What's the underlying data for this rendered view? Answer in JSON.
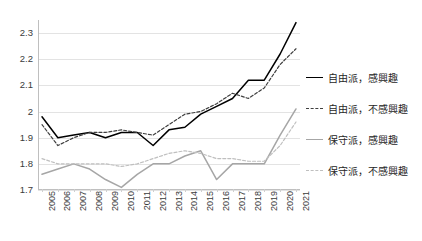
{
  "chart_data": {
    "type": "line",
    "title": "",
    "xlabel": "",
    "ylabel": "",
    "ylim": [
      1.7,
      2.35
    ],
    "yticks": [
      1.7,
      1.8,
      1.9,
      2.0,
      2.1,
      2.2,
      2.3
    ],
    "ytick_labels": [
      "1.7",
      "1.8",
      "1.9",
      "2",
      "2.1",
      "2.2",
      "2.3"
    ],
    "grid": true,
    "legend_position": "right",
    "categories": [
      "2005",
      "2006",
      "2007",
      "2008",
      "2009",
      "2010",
      "2011",
      "2012",
      "2013",
      "2014",
      "2015",
      "2016",
      "2017",
      "2018",
      "2019",
      "2020",
      "2021"
    ],
    "series": [
      {
        "name": "自由派，感興趣",
        "color": "#000000",
        "style": "solid",
        "values": [
          1.98,
          1.9,
          1.91,
          1.92,
          1.9,
          1.92,
          1.92,
          1.87,
          1.93,
          1.94,
          1.99,
          2.02,
          2.05,
          2.12,
          2.12,
          2.22,
          2.34
        ]
      },
      {
        "name": "自由派，不感興趣",
        "color": "#3f3f3f",
        "style": "dashed",
        "values": [
          1.95,
          1.87,
          1.9,
          1.92,
          1.92,
          1.93,
          1.92,
          1.91,
          1.95,
          1.99,
          2.0,
          2.03,
          2.07,
          2.05,
          2.09,
          2.18,
          2.24
        ]
      },
      {
        "name": "保守派，感興趣",
        "color": "#a6a6a6",
        "style": "solid",
        "values": [
          1.76,
          1.78,
          1.8,
          1.78,
          1.74,
          1.71,
          1.76,
          1.8,
          1.8,
          1.83,
          1.85,
          1.74,
          1.8,
          1.8,
          1.8,
          1.91,
          2.01
        ]
      },
      {
        "name": "保守派，不感興趣",
        "color": "#bfbfbf",
        "style": "dashed",
        "values": [
          1.82,
          1.8,
          1.8,
          1.8,
          1.8,
          1.79,
          1.8,
          1.82,
          1.84,
          1.85,
          1.84,
          1.82,
          1.82,
          1.81,
          1.81,
          1.87,
          1.96
        ]
      }
    ]
  },
  "legend": {
    "items": [
      {
        "label": "自由派，感興趣",
        "swatch": "solid-dark"
      },
      {
        "label": "自由派，不感興趣",
        "swatch": "dash-dark"
      },
      {
        "label": "保守派，感興趣",
        "swatch": "solid-gray"
      },
      {
        "label": "保守派，不感興趣",
        "swatch": "dash-gray"
      }
    ]
  }
}
